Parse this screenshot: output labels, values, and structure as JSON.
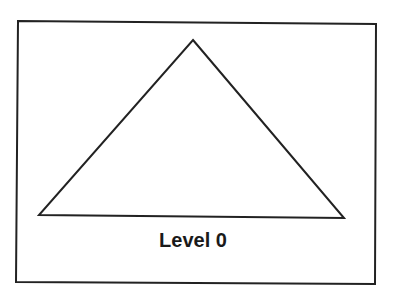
{
  "diagram": {
    "label": "Level 0",
    "shape": "triangle",
    "stroke_color": "#222222",
    "background": "#ffffff"
  }
}
